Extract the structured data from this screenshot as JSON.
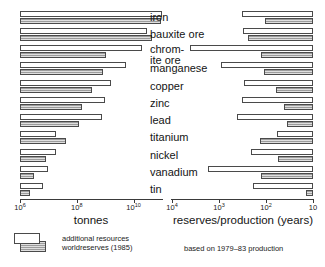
{
  "chart_data": {
    "type": "bar",
    "title": "",
    "orientation": "horizontal-bidirectional",
    "categories": [
      "iron",
      "bauxite ore",
      "chromite ore",
      "manganese",
      "copper",
      "zinc",
      "lead",
      "titanium",
      "nickel",
      "vanadium",
      "tin"
    ],
    "category_labels": [
      "iron",
      "bauxite ore",
      "chrom-\nite ore",
      "manganese",
      "copper",
      "zinc",
      "lead",
      "titanium",
      "nickel",
      "vanadium",
      "tin"
    ],
    "legend": [
      {
        "key": "additional_resources",
        "label": "additional resources",
        "fill": "#ffffff"
      },
      {
        "key": "world_reserves",
        "label": "worldreserves (1985)",
        "fill": "#b9b9b9"
      }
    ],
    "panels": [
      {
        "id": "tonnes",
        "xlabel": "tonnes",
        "scale": "log",
        "direction": "left-to-right",
        "xlim": [
          1000000,
          100000000000
        ],
        "ticks": [
          {
            "value": 1000000,
            "mantissa": "10",
            "exponent": "6"
          },
          {
            "value": 100000000,
            "mantissa": "10",
            "exponent": "8"
          },
          {
            "value": 10000000000,
            "mantissa": "10",
            "exponent": "10"
          }
        ],
        "series": [
          {
            "name": "additional resources",
            "values": [
              300000000000,
              29000000000,
              19000000000,
              5200000000,
              1600000000,
              950000000,
              790000000,
              18000000,
              19000000,
              10000000,
              6200000
            ]
          },
          {
            "name": "worldreserves (1985)",
            "values": [
              95000000000,
              46000000000,
              1100000000,
              810000000,
              340000000,
              148000000,
              120000000,
              42000000,
              8400000,
              3000000,
              2300000
            ]
          }
        ]
      },
      {
        "id": "reserves_production",
        "xlabel": "reserves/production (years)",
        "scale": "log",
        "direction": "right-to-left",
        "xlim": [
          10,
          10000
        ],
        "ticks": [
          {
            "value": 10000,
            "mantissa": "10",
            "exponent": "4"
          },
          {
            "value": 1000,
            "mantissa": "10",
            "exponent": "3"
          },
          {
            "value": 100,
            "mantissa": "10",
            "exponent": "2"
          },
          {
            "value": 10,
            "mantissa": "10",
            "exponent": ""
          }
        ],
        "series": [
          {
            "name": "additional resources",
            "values": [
              330,
              310,
              4200,
              900,
              290,
              330,
              420,
              58,
              210,
              1700,
              190
            ]
          },
          {
            "name": "worldreserves (1985)",
            "values": [
              105,
              240,
              125,
              110,
              62,
              42,
              35,
              135,
              55,
              130,
              14
            ]
          }
        ]
      }
    ],
    "footnote": "based on 1979–83 production"
  }
}
